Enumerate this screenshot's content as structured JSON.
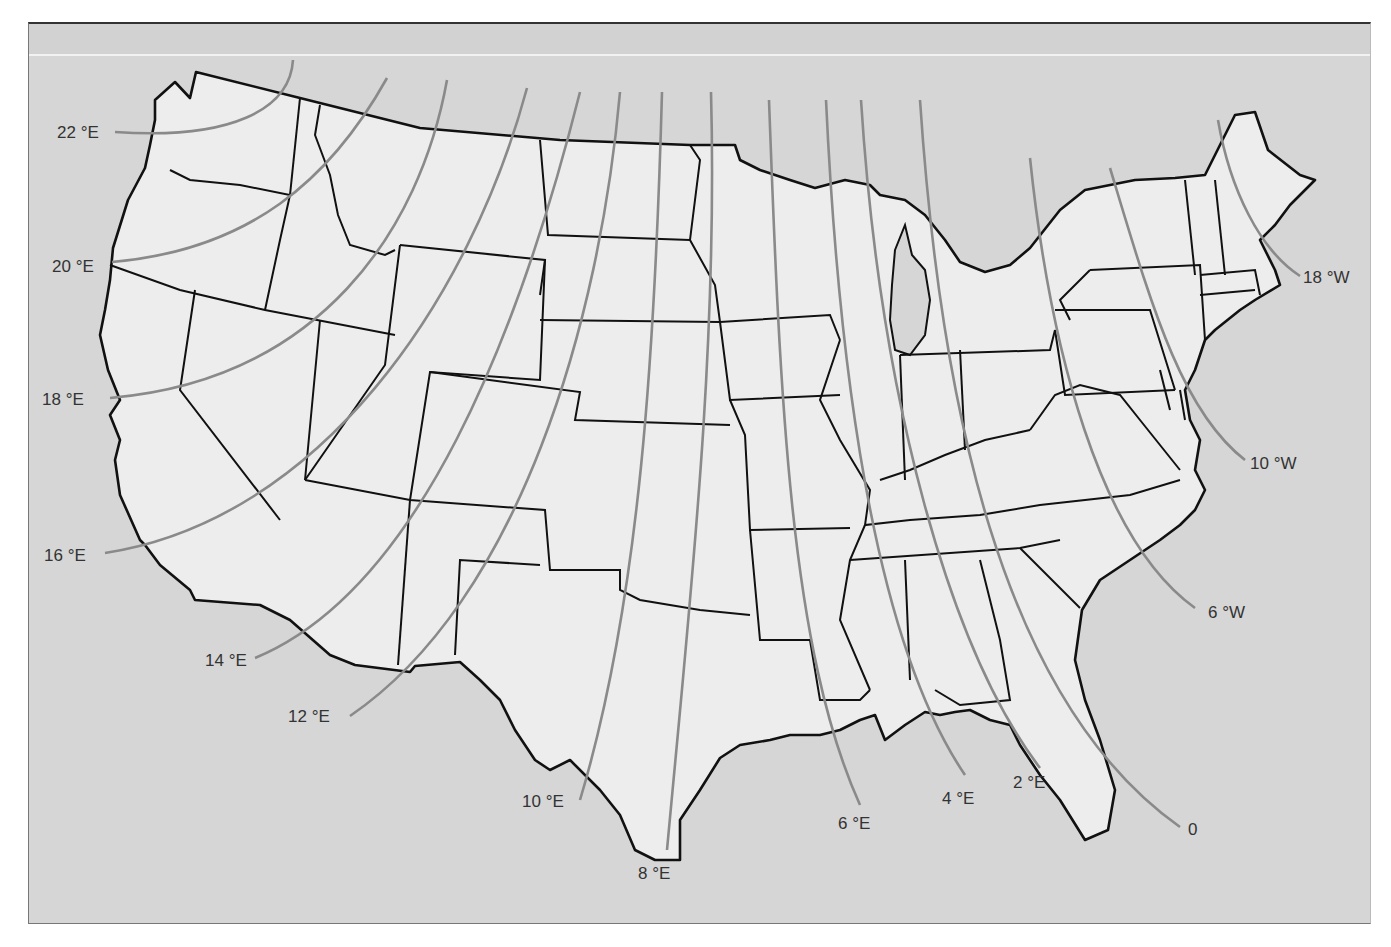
{
  "map": {
    "title": "Isogonic lines of magnetic declination, contiguous United States",
    "colors": {
      "background": "#d6d6d6",
      "land": "#ededed",
      "borders": "#111111",
      "isogonic_lines": "#8a8a8a",
      "labels": "#333333"
    },
    "isogonic_labels": [
      {
        "id": "22E",
        "text": "22 °E"
      },
      {
        "id": "20E",
        "text": "20 °E"
      },
      {
        "id": "18E",
        "text": "18 °E"
      },
      {
        "id": "16E",
        "text": "16 °E"
      },
      {
        "id": "14E",
        "text": "14 °E"
      },
      {
        "id": "12E",
        "text": "12 °E"
      },
      {
        "id": "10E",
        "text": "10 °E"
      },
      {
        "id": "8E",
        "text": "8 °E"
      },
      {
        "id": "6E",
        "text": "6 °E"
      },
      {
        "id": "4E",
        "text": "4 °E"
      },
      {
        "id": "2E",
        "text": "2 °E"
      },
      {
        "id": "0",
        "text": "0"
      },
      {
        "id": "6W",
        "text": "6 °W"
      },
      {
        "id": "10W",
        "text": "10 °W"
      },
      {
        "id": "18W",
        "text": "18 °W"
      }
    ]
  }
}
